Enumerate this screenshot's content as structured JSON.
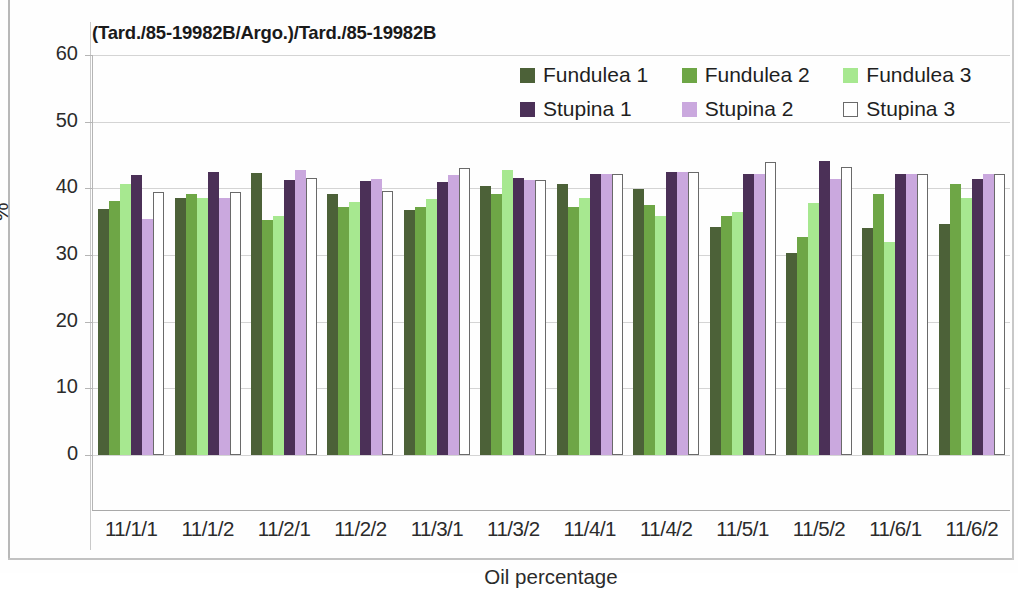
{
  "chart_data": {
    "type": "bar",
    "title": "(Tard./85-19982B/Argo.)/Tard./85-19982B",
    "xlabel": "Oil percentage",
    "ylabel": "%",
    "ylim": [
      0,
      60
    ],
    "yticks": [
      60,
      50,
      40,
      30,
      20,
      10,
      0
    ],
    "grid": true,
    "legend_position": "top-right",
    "categories": [
      "11/1/1",
      "11/1/2",
      "11/2/1",
      "11/2/2",
      "11/3/1",
      "11/3/2",
      "11/4/1",
      "11/4/2",
      "11/5/1",
      "11/5/2",
      "11/6/1",
      "11/6/2"
    ],
    "series": [
      {
        "name": "Fundulea 1",
        "color": "#4c6138",
        "values": [
          36.9,
          38.6,
          42.3,
          39.1,
          36.8,
          40.4,
          40.6,
          39.9,
          34.2,
          30.3,
          34.0,
          34.7
        ]
      },
      {
        "name": "Fundulea 2",
        "color": "#6ea646",
        "values": [
          38.1,
          39.1,
          35.2,
          37.2,
          37.2,
          39.2,
          37.2,
          37.5,
          35.8,
          32.7,
          39.2,
          40.7
        ]
      },
      {
        "name": "Fundulea 3",
        "color": "#a7e890",
        "values": [
          40.6,
          38.6,
          35.9,
          38.0,
          38.4,
          42.8,
          38.5,
          35.8,
          36.5,
          37.8,
          32.0,
          38.5
        ]
      },
      {
        "name": "Stupina 1",
        "color": "#4b3057",
        "values": [
          42.0,
          42.5,
          41.3,
          41.1,
          41.0,
          41.6,
          42.2,
          42.5,
          42.2,
          44.1,
          42.2,
          41.4
        ]
      },
      {
        "name": "Stupina 2",
        "color": "#caa8de",
        "values": [
          35.4,
          38.5,
          42.8,
          41.4,
          42.0,
          41.2,
          42.1,
          42.5,
          42.1,
          41.4,
          42.1,
          42.2
        ]
      },
      {
        "name": "Stupina 3",
        "color": "#ffffff",
        "values": [
          39.5,
          39.5,
          41.6,
          39.6,
          43.1,
          41.3,
          42.2,
          42.5,
          44.0,
          43.2,
          42.2,
          42.2
        ]
      }
    ]
  }
}
